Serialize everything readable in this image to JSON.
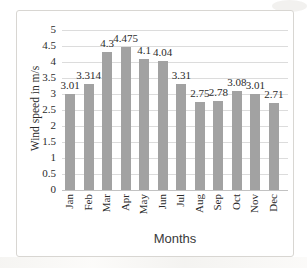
{
  "figure": {
    "background_color": "#ffffff",
    "frame_border_color": "#d8d6d2"
  },
  "chart_data": {
    "type": "bar",
    "title": "",
    "categories": [
      "Jan",
      "Feb",
      "Mar",
      "Apr",
      "May",
      "Jun",
      "Jul",
      "Aug",
      "Sep",
      "Oct",
      "Nov",
      "Dec"
    ],
    "values": [
      3.01,
      3.314,
      4.3,
      4.475,
      4.1,
      4.04,
      3.31,
      2.75,
      2.78,
      3.08,
      3.01,
      2.71
    ],
    "data_labels": [
      "3.01",
      "3.314",
      "4.3",
      "4.475",
      "4.1",
      "4.04",
      "3.31",
      "2.75",
      "2.78",
      "3.08",
      "3.01",
      "2.71"
    ],
    "xlabel": "Months",
    "ylabel": "Wind speed in m/s",
    "ylim": [
      0,
      5
    ],
    "ytick_step": 0.5,
    "yticks": [
      "0",
      "0.5",
      "1",
      "1.5",
      "2",
      "2.5",
      "3",
      "3.5",
      "4",
      "4.5",
      "5"
    ],
    "grid": true,
    "legend": false,
    "bar_color": "#a2a2a2",
    "gridline_color": "#dcdcdc",
    "axis_line_color": "#c2c2c2",
    "text_color": "#2b2b2b"
  }
}
